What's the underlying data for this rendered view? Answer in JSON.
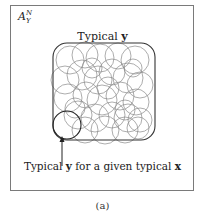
{
  "set_label": {
    "base": "A",
    "sup": "N",
    "sub": "Y"
  },
  "top_label": {
    "prefix": "Typical ",
    "bold": "y"
  },
  "bottom_label": {
    "prefix": "Typical ",
    "bold1": "y",
    "middle": " for a given typical ",
    "bold2": "x"
  },
  "caption": "(a)",
  "colors": {
    "frame": "#7a7a7a",
    "circles": "#8a8a8a",
    "highlight": "#222222",
    "box": "#333333"
  }
}
